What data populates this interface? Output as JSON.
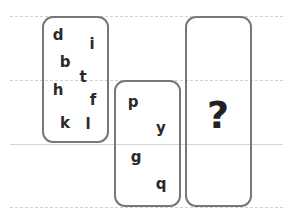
{
  "puzzle": {
    "guide_lines": [
      {
        "y": 16,
        "style": "dashed"
      },
      {
        "y": 80,
        "style": "dashed"
      },
      {
        "y": 144,
        "style": "solid"
      },
      {
        "y": 207,
        "style": "dashed"
      }
    ],
    "box1": {
      "letters": [
        {
          "char": "d",
          "x": 58,
          "y": 35
        },
        {
          "char": "i",
          "x": 92,
          "y": 44
        },
        {
          "char": "b",
          "x": 65,
          "y": 62
        },
        {
          "char": "t",
          "x": 83,
          "y": 77
        },
        {
          "char": "h",
          "x": 58,
          "y": 90
        },
        {
          "char": "f",
          "x": 93,
          "y": 100
        },
        {
          "char": "k",
          "x": 65,
          "y": 123
        },
        {
          "char": "l",
          "x": 88,
          "y": 124
        }
      ]
    },
    "box2": {
      "letters": [
        {
          "char": "p",
          "x": 133,
          "y": 102
        },
        {
          "char": "y",
          "x": 161,
          "y": 128
        },
        {
          "char": "g",
          "x": 136,
          "y": 157
        },
        {
          "char": "q",
          "x": 161,
          "y": 184
        }
      ]
    },
    "box3": {
      "question_mark": "?"
    }
  }
}
